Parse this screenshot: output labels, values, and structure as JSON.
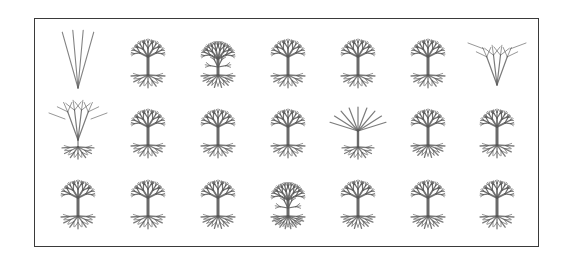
{
  "figure": {
    "stroke_color": "#5a5a5a",
    "border_color": "#3a3a3a",
    "rows": 3,
    "cols": 7,
    "col_centers": [
      78,
      148,
      218,
      288,
      358,
      428,
      497
    ],
    "row_centers": [
      60,
      130,
      201
    ],
    "cells": [
      {
        "row": 0,
        "col": 0,
        "kind": "fan",
        "branches": 4,
        "depth": 1,
        "roots": 0,
        "density": "sparse"
      },
      {
        "row": 0,
        "col": 1,
        "kind": "tree",
        "branches": 5,
        "depth": 3,
        "roots": 7,
        "density": "dense"
      },
      {
        "row": 0,
        "col": 2,
        "kind": "bush",
        "branches": 6,
        "depth": 3,
        "roots": 8,
        "density": "dense"
      },
      {
        "row": 0,
        "col": 3,
        "kind": "tree",
        "branches": 5,
        "depth": 3,
        "roots": 7,
        "density": "dense"
      },
      {
        "row": 0,
        "col": 4,
        "kind": "tree",
        "branches": 5,
        "depth": 3,
        "roots": 7,
        "density": "dense"
      },
      {
        "row": 0,
        "col": 5,
        "kind": "tree",
        "branches": 5,
        "depth": 3,
        "roots": 7,
        "density": "dense"
      },
      {
        "row": 0,
        "col": 6,
        "kind": "cone",
        "branches": 4,
        "depth": 2,
        "roots": 0,
        "density": "sparse"
      },
      {
        "row": 1,
        "col": 0,
        "kind": "cone-root",
        "branches": 4,
        "depth": 2,
        "roots": 7,
        "density": "sparse"
      },
      {
        "row": 1,
        "col": 1,
        "kind": "tree",
        "branches": 5,
        "depth": 3,
        "roots": 7,
        "density": "dense"
      },
      {
        "row": 1,
        "col": 2,
        "kind": "tree",
        "branches": 5,
        "depth": 3,
        "roots": 7,
        "density": "dense"
      },
      {
        "row": 1,
        "col": 3,
        "kind": "tree",
        "branches": 5,
        "depth": 3,
        "roots": 7,
        "density": "dense"
      },
      {
        "row": 1,
        "col": 4,
        "kind": "broom",
        "branches": 9,
        "depth": 2,
        "roots": 7,
        "density": "medium"
      },
      {
        "row": 1,
        "col": 5,
        "kind": "tree",
        "branches": 5,
        "depth": 3,
        "roots": 8,
        "density": "dense"
      },
      {
        "row": 1,
        "col": 6,
        "kind": "tree",
        "branches": 5,
        "depth": 3,
        "roots": 7,
        "density": "dense"
      },
      {
        "row": 2,
        "col": 0,
        "kind": "tree",
        "branches": 5,
        "depth": 3,
        "roots": 7,
        "density": "dense"
      },
      {
        "row": 2,
        "col": 1,
        "kind": "tree",
        "branches": 5,
        "depth": 3,
        "roots": 7,
        "density": "dense"
      },
      {
        "row": 2,
        "col": 2,
        "kind": "tree",
        "branches": 5,
        "depth": 3,
        "roots": 8,
        "density": "dense"
      },
      {
        "row": 2,
        "col": 3,
        "kind": "bush",
        "branches": 6,
        "depth": 3,
        "roots": 10,
        "density": "dense"
      },
      {
        "row": 2,
        "col": 4,
        "kind": "tree",
        "branches": 5,
        "depth": 3,
        "roots": 8,
        "density": "dense"
      },
      {
        "row": 2,
        "col": 5,
        "kind": "tree",
        "branches": 5,
        "depth": 3,
        "roots": 8,
        "density": "dense"
      },
      {
        "row": 2,
        "col": 6,
        "kind": "tree",
        "branches": 5,
        "depth": 3,
        "roots": 7,
        "density": "dense"
      }
    ]
  }
}
